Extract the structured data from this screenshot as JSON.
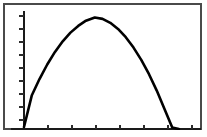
{
  "window": {
    "title": "Graphing Calculator Display",
    "frame_color": "#4a4a4a",
    "background_color": "#ffffff"
  },
  "plot": {
    "curve_color": "#000000",
    "axis_color": "#1a1a1a",
    "tick_color": "#2b2b2b",
    "curve_label": "parabola-trajectory",
    "x_axis_label": "",
    "y_axis_label": "",
    "title": ""
  },
  "chart_data": {
    "type": "line",
    "title": "",
    "xlabel": "",
    "ylabel": "",
    "grid": false,
    "legend": "none",
    "axis_style": "graphing-calculator",
    "xlim": [
      0,
      8
    ],
    "ylim": [
      0,
      9
    ],
    "x_tick_count": 8,
    "x_tick_interval": 1,
    "y_tick_count": 8,
    "y_tick_interval": 1,
    "vertex": [
      3.2,
      8.5
    ],
    "x_intercept_right": 7.0,
    "y_start": 2.3,
    "equation": "y = -0.82(x - 3.2)^2 + 8.5",
    "series": [
      {
        "name": "parabola",
        "x": [
          0.0,
          0.35,
          0.7,
          1.05,
          1.4,
          1.75,
          2.1,
          2.45,
          2.8,
          3.2,
          3.55,
          3.9,
          4.25,
          4.6,
          4.95,
          5.3,
          5.65,
          6.0,
          6.35,
          6.7,
          7.0
        ],
        "y": [
          0.15,
          2.55,
          3.81,
          4.92,
          5.88,
          6.69,
          7.35,
          7.86,
          8.26,
          8.5,
          8.4,
          8.1,
          7.63,
          7.0,
          6.21,
          5.27,
          4.18,
          2.93,
          1.52,
          0.12,
          0.0
        ]
      }
    ]
  }
}
